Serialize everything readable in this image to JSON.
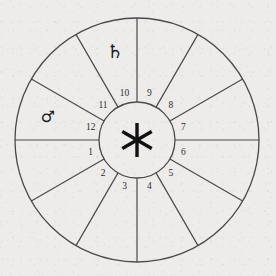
{
  "chart_data": {
    "type": "pie",
    "title": "",
    "subtitle": "",
    "xlabel": "",
    "ylabel": "",
    "legend_position": "none",
    "grid": false,
    "categories": [
      "1",
      "2",
      "3",
      "4",
      "5",
      "6",
      "7",
      "8",
      "9",
      "10",
      "11",
      "12"
    ],
    "values": [
      30,
      30,
      30,
      30,
      30,
      30,
      30,
      30,
      30,
      30,
      30,
      30
    ],
    "units": "degrees",
    "annotations": [
      {
        "label": "♄",
        "name": "saturn",
        "house": "10"
      },
      {
        "label": "♂",
        "name": "mars",
        "house": "12"
      },
      {
        "label": "✶",
        "name": "sextile",
        "house": "center"
      }
    ]
  },
  "wheel": {
    "center_x": 137,
    "center_y": 140,
    "outer_radius": 122,
    "inner_radius": 38,
    "spoke_count": 12,
    "spoke_step_degrees": 30,
    "stroke_color": "#4a4a4a",
    "background_color": "#edeceb",
    "ink_color": "#2d2d2d"
  },
  "houses": [
    {
      "number": "1",
      "angle": 195,
      "label_radius": 48
    },
    {
      "number": "2",
      "angle": 225,
      "label_radius": 48
    },
    {
      "number": "3",
      "angle": 255,
      "label_radius": 48
    },
    {
      "number": "4",
      "angle": 285,
      "label_radius": 48
    },
    {
      "number": "5",
      "angle": 315,
      "label_radius": 48
    },
    {
      "number": "6",
      "angle": 345,
      "label_radius": 48
    },
    {
      "number": "7",
      "angle": 15,
      "label_radius": 48
    },
    {
      "number": "8",
      "angle": 45,
      "label_radius": 48
    },
    {
      "number": "9",
      "angle": 75,
      "label_radius": 48
    },
    {
      "number": "10",
      "angle": 105,
      "label_radius": 48
    },
    {
      "number": "11",
      "angle": 135,
      "label_radius": 48
    },
    {
      "number": "12",
      "angle": 165,
      "label_radius": 48
    }
  ],
  "planets": [
    {
      "name": "saturn",
      "glyph": "♄",
      "x": 115,
      "y": 52,
      "size": 19
    },
    {
      "name": "mars",
      "glyph": "♂",
      "x": 48,
      "y": 117,
      "size": 16
    }
  ],
  "center_symbol": {
    "name": "sextile-aspect",
    "glyph": "✶",
    "x": 137,
    "y": 140,
    "arm_length": 17,
    "arm_count": 6
  }
}
